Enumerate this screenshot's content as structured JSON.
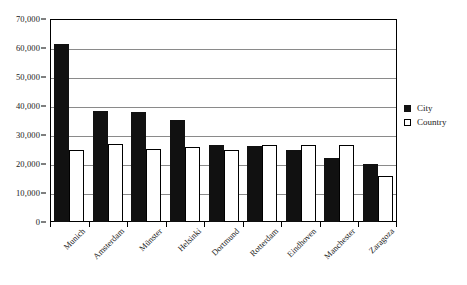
{
  "chart_data": {
    "type": "bar",
    "title": "",
    "subtitle": "",
    "xlabel": "",
    "ylabel": "",
    "ylim": [
      0,
      70000
    ],
    "y_ticks": [
      "0",
      "10,000",
      "20,000",
      "30,000",
      "40,000",
      "50,000",
      "60,000",
      "70,000"
    ],
    "y_tick_values": [
      0,
      10000,
      20000,
      30000,
      40000,
      50000,
      60000,
      70000
    ],
    "grid": "horizontal",
    "legend_position": "right",
    "categories": [
      "Munich",
      "Amsterdam",
      "Münster",
      "Helsinki",
      "Dortmund",
      "Rotterdam",
      "Eindhoven",
      "Manchester",
      "Zaragoza"
    ],
    "series": [
      {
        "name": "City",
        "color": "#111111",
        "values": [
          61500,
          38200,
          38000,
          35200,
          26500,
          26100,
          25000,
          22000,
          20000
        ]
      },
      {
        "name": "Country",
        "color": "#ffffff",
        "values": [
          25000,
          26800,
          25100,
          26000,
          25000,
          26700,
          26700,
          26500,
          16000
        ]
      }
    ]
  },
  "legend": {
    "items": [
      {
        "label": "City",
        "swatch": "filled-square-icon"
      },
      {
        "label": "Country",
        "swatch": "hollow-square-icon"
      }
    ]
  },
  "colors": {
    "series_city": "#111111",
    "series_country": "#ffffff",
    "axis": "#000000",
    "gridline": "#8a8a8a",
    "background": "#ffffff",
    "text": "#1a1a1a"
  }
}
